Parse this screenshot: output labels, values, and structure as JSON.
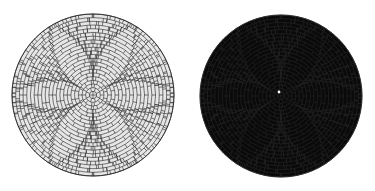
{
  "figure": {
    "background": "#ffffff",
    "panels": [
      {
        "name": "light-spiral-brick-disc",
        "fill": "#e6e6e6",
        "stroke": "#222222",
        "center": [
          93,
          95
        ],
        "radius": 81,
        "rings": 22,
        "arms": 6,
        "twist": 2.2
      },
      {
        "name": "dark-spiral-brick-disc",
        "fill": "#0a0a0a",
        "stroke": "#262626",
        "center": [
          281,
          96
        ],
        "radius": 81,
        "rings": 22,
        "arms": 6,
        "twist": 2.2,
        "center_dot_color": "#ffffff"
      }
    ]
  }
}
